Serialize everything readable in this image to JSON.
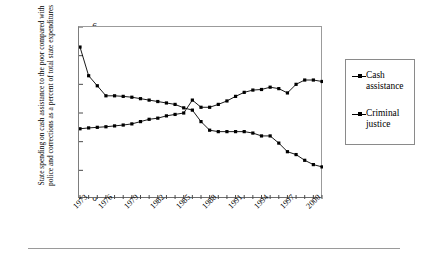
{
  "axis": {
    "y_title": "State spending on cash assistance to the poor compared with police and corrections as a percent of total state expenditures",
    "y_ticks": [
      "0",
      "1",
      "2",
      "3",
      "4",
      "5",
      "6"
    ],
    "x_ticks": [
      "1973",
      "1976",
      "1979",
      "1982",
      "1985",
      "1988",
      "1991",
      "1994",
      "1997",
      "2000"
    ]
  },
  "legend": {
    "items": [
      {
        "label_line1": "Cash",
        "label_line2": "assistance",
        "marker": "line-square-marker"
      },
      {
        "label_line1": "Criminal",
        "label_line2": "justice",
        "marker": "line-square-marker"
      }
    ]
  },
  "colors": {
    "series": "#000000",
    "frame": "#8a8a8a",
    "rule": "#9a9a9a",
    "background": "#ffffff"
  },
  "chart_data": {
    "type": "line",
    "title": "",
    "subtitle": "",
    "xlabel": "",
    "ylabel": "State spending on cash assistance to the poor compared with police and corrections as a percent of total state expenditures",
    "xlim": [
      1973,
      2001
    ],
    "ylim": [
      0,
      6
    ],
    "ytick_values": [
      0,
      1,
      2,
      3,
      4,
      5,
      6
    ],
    "xtick_values": [
      1973,
      1976,
      1979,
      1982,
      1985,
      1988,
      1991,
      1994,
      1997,
      2000
    ],
    "grid": false,
    "legend_position": "right-outside",
    "marker": "square",
    "x": [
      1973,
      1974,
      1975,
      1976,
      1977,
      1978,
      1979,
      1980,
      1981,
      1982,
      1983,
      1984,
      1985,
      1986,
      1987,
      1988,
      1989,
      1990,
      1991,
      1992,
      1993,
      1994,
      1995,
      1996,
      1997,
      1998,
      1999,
      2000,
      2001
    ],
    "series": [
      {
        "name": "Cash assistance",
        "values": [
          5.3,
          4.3,
          3.95,
          3.6,
          3.6,
          3.58,
          3.55,
          3.5,
          3.45,
          3.4,
          3.35,
          3.3,
          3.18,
          3.1,
          2.7,
          2.4,
          2.35,
          2.35,
          2.35,
          2.35,
          2.3,
          2.2,
          2.2,
          1.95,
          1.65,
          1.55,
          1.35,
          1.2,
          1.12
        ]
      },
      {
        "name": "Criminal justice",
        "values": [
          2.45,
          2.48,
          2.5,
          2.52,
          2.55,
          2.58,
          2.62,
          2.7,
          2.78,
          2.82,
          2.9,
          2.95,
          3.0,
          3.45,
          3.2,
          3.2,
          3.3,
          3.42,
          3.58,
          3.72,
          3.8,
          3.82,
          3.9,
          3.85,
          3.7,
          4.0,
          4.15,
          4.15,
          4.1
        ]
      }
    ]
  }
}
